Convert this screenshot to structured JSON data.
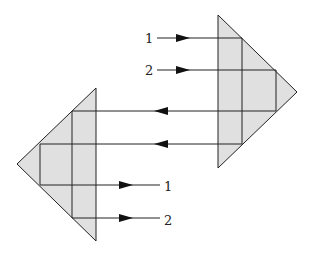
{
  "diagram": {
    "colors": {
      "prism_fill": "#e0e0e0",
      "line": "#222222",
      "background": "#ffffff"
    },
    "prisms": [
      {
        "name": "right-prism",
        "vertices": [
          [
            218,
            15
          ],
          [
            297,
            92
          ],
          [
            218,
            168
          ]
        ]
      },
      {
        "name": "left-prism",
        "vertices": [
          [
            96,
            88
          ],
          [
            17,
            164
          ],
          [
            96,
            241
          ]
        ]
      }
    ],
    "input_rays": [
      {
        "label": "1",
        "y": 38
      },
      {
        "label": "2",
        "y": 70
      }
    ],
    "output_rays": [
      {
        "label": "1",
        "y": 185
      },
      {
        "label": "2",
        "y": 218
      }
    ],
    "connecting_rays": [
      {
        "y": 111,
        "direction": "left"
      },
      {
        "y": 144,
        "direction": "left"
      }
    ]
  }
}
